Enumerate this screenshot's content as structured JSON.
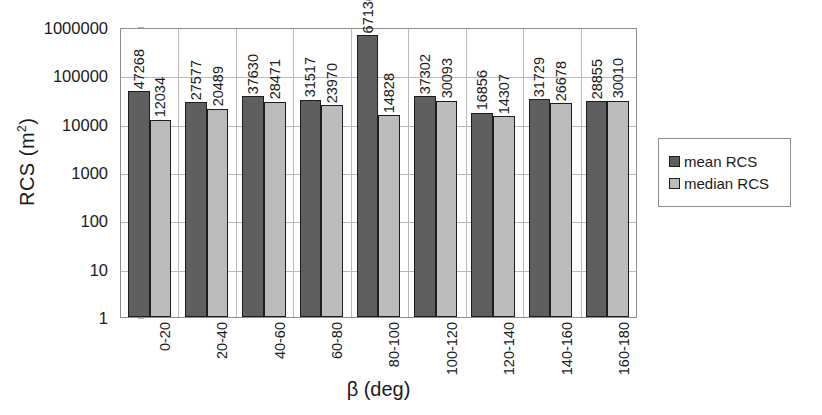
{
  "chart_data": {
    "type": "bar",
    "title": "",
    "xlabel": "β (deg)",
    "ylabel": "RCS (m²)",
    "yscale": "log",
    "ylim": [
      1,
      1000000
    ],
    "ytick_labels": [
      "1000000",
      "100000",
      "10000",
      "1000",
      "100",
      "10",
      "1"
    ],
    "ytick_values": [
      1000000,
      100000,
      10000,
      1000,
      100,
      10,
      1
    ],
    "grid": true,
    "legend_position": "right",
    "categories": [
      "0-20",
      "20-40",
      "40-60",
      "60-80",
      "80-100",
      "100-120",
      "120-140",
      "140-160",
      "160-180"
    ],
    "series": [
      {
        "name": "mean RCS",
        "color": "#5f5f5f",
        "values": [
          47268,
          27577,
          37630,
          31517,
          671361,
          37302,
          16856,
          31729,
          28855
        ],
        "labels": [
          "47268",
          "27577",
          "37630",
          "31517",
          "671361",
          "37302",
          "16856",
          "31729",
          "28855"
        ]
      },
      {
        "name": "median RCS",
        "color": "#bcbcbc",
        "values": [
          12034,
          20489,
          28471,
          23970,
          14828,
          30093,
          14307,
          26678,
          30010
        ],
        "labels": [
          "12034",
          "20489",
          "28471",
          "23970",
          "14828",
          "30093",
          "14307",
          "26678",
          "30010"
        ]
      }
    ]
  },
  "axes": {
    "y_title_main": "RCS (m",
    "y_title_sup": "2",
    "y_title_close": ")",
    "x_title": "β (deg)"
  },
  "legend": {
    "items": [
      {
        "label": "mean RCS",
        "color": "#5f5f5f"
      },
      {
        "label": "median RCS",
        "color": "#bcbcbc"
      }
    ]
  },
  "colors": {
    "mean": "#5f5f5f",
    "median": "#bcbcbc",
    "grid": "#b9b9b9",
    "axis": "#8d8d8d",
    "text": "#1a1a1a",
    "background": "#ffffff"
  }
}
